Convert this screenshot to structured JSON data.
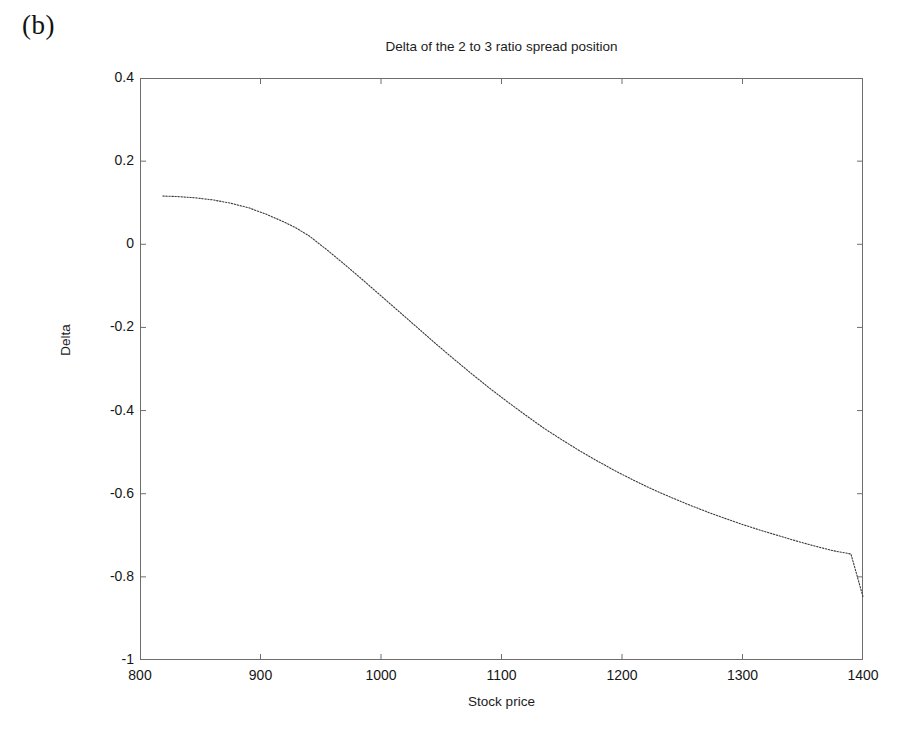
{
  "panel": {
    "label": "(b)"
  },
  "chart_data": {
    "type": "line",
    "title": "Delta of the 2 to 3 ratio spread position",
    "xlabel": "Stock price",
    "ylabel": "Delta",
    "xlim": [
      800,
      1400
    ],
    "ylim": [
      -1,
      0.4
    ],
    "xticks": [
      800,
      900,
      1000,
      1100,
      1200,
      1300,
      1400
    ],
    "yticks": [
      0.4,
      0.2,
      0,
      -0.2,
      -0.4,
      -0.6,
      -0.8,
      -1
    ],
    "xtick_labels": [
      "800",
      "900",
      "1000",
      "1100",
      "1200",
      "1300",
      "1400"
    ],
    "ytick_labels": [
      "0.4",
      "0.2",
      "0",
      "-0.2",
      "-0.4",
      "-0.6",
      "-0.8",
      "-1"
    ],
    "grid": false,
    "legend": null,
    "line_style": "dotted",
    "line_color": "#3a3a3a",
    "series": [
      {
        "name": "Delta of the 2 to 3 ratio spread position",
        "x": [
          819,
          830,
          845,
          860,
          875,
          890,
          905,
          920,
          929,
          940,
          955,
          970,
          985,
          1000,
          1015,
          1030,
          1045,
          1060,
          1075,
          1090,
          1105,
          1120,
          1135,
          1150,
          1165,
          1180,
          1195,
          1210,
          1225,
          1240,
          1255,
          1270,
          1285,
          1300,
          1315,
          1330,
          1345,
          1360,
          1375,
          1390,
          1400
        ],
        "y": [
          0.116,
          0.115,
          0.112,
          0.107,
          0.099,
          0.088,
          0.072,
          0.053,
          0.04,
          0.021,
          -0.013,
          -0.049,
          -0.086,
          -0.124,
          -0.162,
          -0.2,
          -0.238,
          -0.275,
          -0.311,
          -0.346,
          -0.379,
          -0.411,
          -0.442,
          -0.47,
          -0.497,
          -0.522,
          -0.546,
          -0.568,
          -0.589,
          -0.608,
          -0.626,
          -0.643,
          -0.659,
          -0.674,
          -0.688,
          -0.701,
          -0.714,
          -0.726,
          -0.737,
          -0.745,
          -0.848
        ]
      }
    ]
  }
}
